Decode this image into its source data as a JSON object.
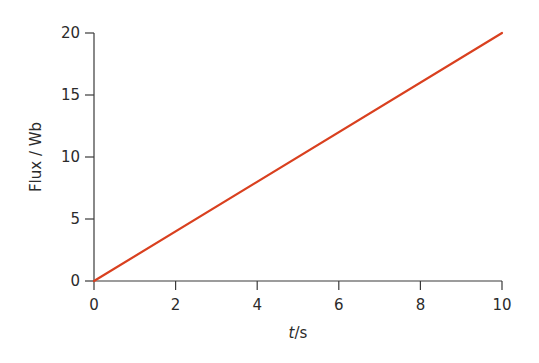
{
  "chart_data": {
    "type": "line",
    "title": "",
    "xlabel_italic": "t",
    "xlabel_unit": "/s",
    "xlabel": "t/s",
    "ylabel": "Flux / Wb",
    "xlim": [
      0,
      10
    ],
    "ylim": [
      0,
      20
    ],
    "xticks": [
      0,
      2,
      4,
      6,
      8,
      10
    ],
    "yticks": [
      0,
      5,
      10,
      15,
      20
    ],
    "grid": false,
    "legend": null,
    "series": [
      {
        "name": "Flux",
        "color": "#d9401f",
        "x": [
          0,
          10
        ],
        "y": [
          0,
          20
        ]
      }
    ]
  }
}
